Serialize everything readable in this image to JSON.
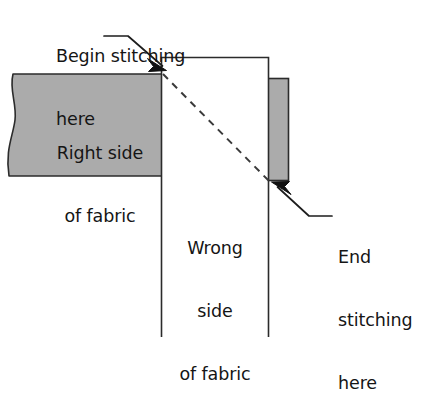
{
  "figure": {
    "background_color": "#ffffff",
    "fabric_gray": "#ababab",
    "outline_color": "#2b2b2b",
    "text_color": "#151515",
    "width": 432,
    "height": 365
  },
  "labels": {
    "begin_stitching": {
      "line1": "Begin stitching",
      "line2": "here"
    },
    "right_side": {
      "line1": "Right side",
      "line2": "of fabric"
    },
    "wrong_side": {
      "line1": "Wrong",
      "line2": "side",
      "line3": "of fabric"
    },
    "end_stitching": {
      "line1": "End",
      "line2": "stitching",
      "line3": "here"
    }
  },
  "shapes": {
    "right_side_fabric": {
      "name": "Right side of fabric",
      "fill": "#ababab",
      "stroke": "#2b2b2b"
    },
    "wrong_side_fabric": {
      "name": "Wrong side of fabric",
      "fill": "#ffffff",
      "stroke": "#2b2b2b"
    },
    "right_gray_strip": {
      "name": "Folded fabric edge",
      "fill": "#ababab",
      "stroke": "#2b2b2b"
    },
    "stitching_line": {
      "name": "Diagonal stitching line",
      "style": "dashed",
      "stroke": "#3a3a3a",
      "dash": "7 6"
    }
  }
}
